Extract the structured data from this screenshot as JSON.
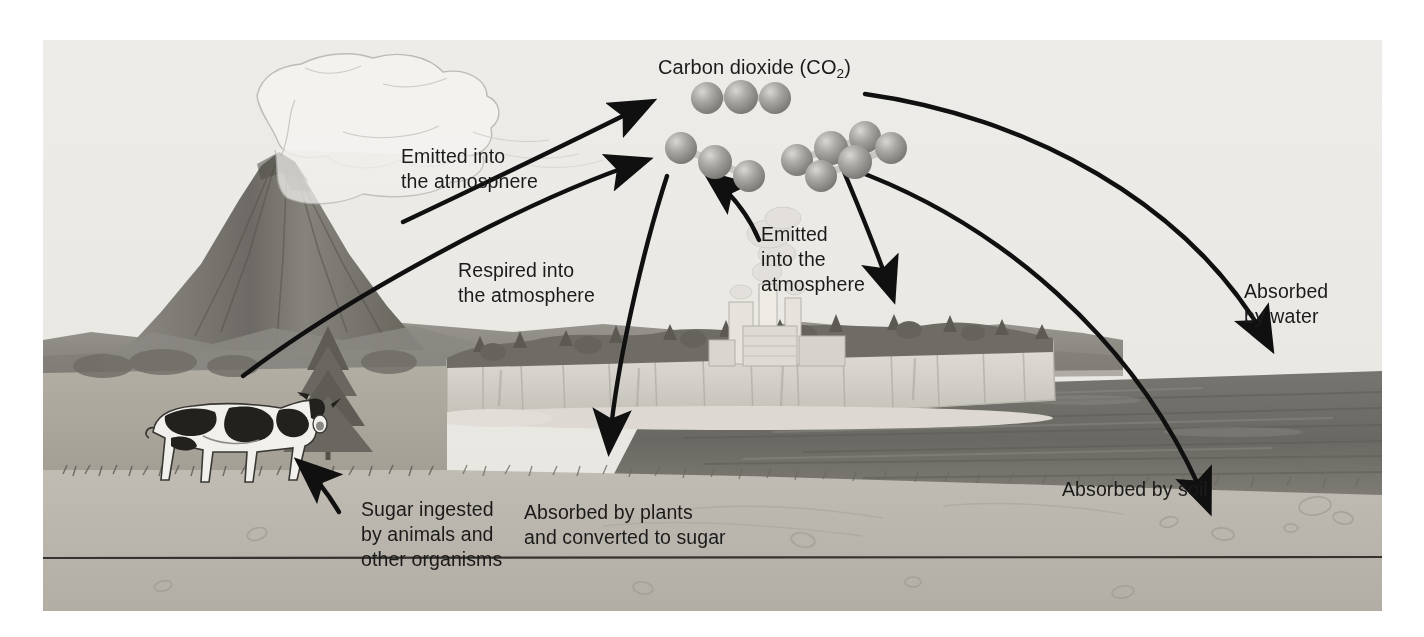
{
  "figure": {
    "style": "grayscale scientific illustration",
    "background_color": "#eceae6",
    "border_color": "#bdbab4"
  },
  "molecule_label": {
    "prefix": "Carbon dioxide (CO",
    "subscript": "2",
    "suffix": ")"
  },
  "labels": {
    "volcano_emission": "Emitted into\nthe atmosphere",
    "respiration": "Respired into\nthe atmosphere",
    "factory_emission": "Emitted\ninto the\natmosphere",
    "absorbed_water": "Absorbed\nby water",
    "absorbed_plants": "Absorbed by plants\nand converted to sugar",
    "absorbed_soil": "Absorbed by soil",
    "sugar_ingested": "Sugar ingested\nby animals and\nother organisms"
  },
  "scene": {
    "volcano": "erupting volcano with ash plume",
    "cow": "holstein cow grazing on grassland",
    "conifer": "conifer tree",
    "factory": "industrial plant with smokestacks",
    "cliffs": "white chalk cliffs",
    "water": "dark water body",
    "soil": "sandy soil foreground",
    "subsurface_line": "horizontal cross-section line"
  },
  "molecules": [
    {
      "name": "co2-molecule-1",
      "atoms": 3
    },
    {
      "name": "co2-molecule-2",
      "atoms": 3
    },
    {
      "name": "co2-molecule-3",
      "atoms": 3
    },
    {
      "name": "co2-molecule-4",
      "atoms": 3
    }
  ],
  "arrows": [
    {
      "name": "arrow-volcano-to-co2",
      "from": "volcano plume",
      "to": "co2 cluster"
    },
    {
      "name": "arrow-cow-to-co2",
      "from": "cow",
      "to": "co2 cluster"
    },
    {
      "name": "arrow-factory-to-co2",
      "from": "factory",
      "to": "co2 cluster"
    },
    {
      "name": "arrow-co2-to-plants",
      "from": "co2 cluster",
      "to": "plants"
    },
    {
      "name": "arrow-co2-to-trees",
      "from": "co2 cluster",
      "to": "cliff-top trees"
    },
    {
      "name": "arrow-co2-to-water",
      "from": "co2 cluster",
      "to": "water"
    },
    {
      "name": "arrow-co2-to-soil",
      "from": "co2 cluster",
      "to": "soil"
    },
    {
      "name": "arrow-sugar-to-cow",
      "from": "sugar label",
      "to": "cow"
    }
  ],
  "colors": {
    "sky": "#eceae6",
    "ink": "#1b1b1b",
    "molecule": "#9a9894",
    "water": "#6e6e6e",
    "soil": "#b9b5ad",
    "grass": "#a8a49b",
    "cliff": "#d8d5cf",
    "hill": "#8d8a84"
  }
}
